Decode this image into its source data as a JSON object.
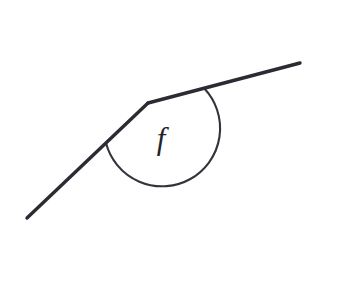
{
  "figure": {
    "kind": "geometry-angle-diagram",
    "title": "Angle f formed by two rays at a vertex",
    "canvas": {
      "width": 353,
      "height": 297,
      "background": "#ffffff"
    },
    "stroke_color": "#2b2b33",
    "arc_color": "#33333b",
    "label_color": "#23232b",
    "label": "f",
    "vertex": {
      "x": 148,
      "y": 103
    },
    "rays": [
      {
        "name": "left-ray",
        "from": {
          "x": 27,
          "y": 218
        },
        "to": {
          "x": 148,
          "y": 103
        },
        "path": "M 27 218 L 148 103"
      },
      {
        "name": "right-ray",
        "from": {
          "x": 148,
          "y": 103
        },
        "to": {
          "x": 300,
          "y": 63
        },
        "path": "M 148 103 L 300 63"
      }
    ],
    "arc": {
      "name": "angle-arc",
      "center": {
        "x": 148,
        "y": 103
      },
      "radius": 58,
      "start_point": {
        "x": 106,
        "y": 147
      },
      "end_point": {
        "x": 204,
        "y": 88
      },
      "start_angle_deg": 136.5,
      "end_angle_deg": 345.3,
      "sweep_deg": 208.8,
      "path": "M 106.0 143.0 A 58 58 0 1 0 204.1 88.3"
    },
    "label_position": {
      "x": 161,
      "y": 149
    }
  }
}
